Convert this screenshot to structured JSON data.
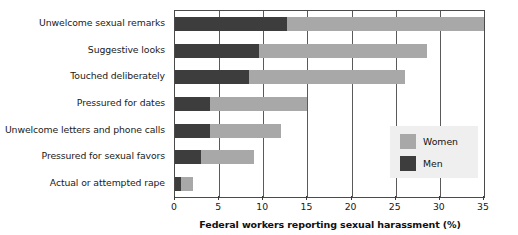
{
  "chart_data": {
    "type": "bar",
    "orientation": "horizontal",
    "stacked": true,
    "title": "",
    "xlabel": "Federal workers reporting sexual harassment (%)",
    "ylabel": "",
    "xlim": [
      0,
      35
    ],
    "xticks": [
      0,
      5,
      10,
      15,
      20,
      25,
      30,
      35
    ],
    "xtick_labels": [
      "0",
      "5",
      "10",
      "15",
      "20",
      "25",
      "30",
      "35"
    ],
    "grid": true,
    "legend_position": "inside-right",
    "categories": [
      "Unwelcome sexual remarks",
      "Suggestive looks",
      "Touched deliberately",
      "Pressured for dates",
      "Unwelcome letters and phone calls",
      "Pressured for sexual favors",
      "Actual or attempted rape"
    ],
    "series": [
      {
        "name": "Men",
        "color": "#3d3d3d",
        "values": [
          12.7,
          9.5,
          8.4,
          4.0,
          4.0,
          3.0,
          0.7
        ]
      },
      {
        "name": "Women",
        "color": "#a8a8a8",
        "values": [
          22.3,
          19.0,
          17.6,
          11.0,
          8.0,
          6.0,
          1.3
        ]
      }
    ],
    "totals": [
      35.0,
      28.5,
      26.0,
      15.0,
      12.0,
      9.0,
      2.0
    ]
  },
  "legend": {
    "entries": [
      {
        "label": "Women",
        "color": "#a8a8a8"
      },
      {
        "label": "Men",
        "color": "#3d3d3d"
      }
    ]
  },
  "colors": {
    "men": "#3d3d3d",
    "women": "#a8a8a8",
    "axis": "#4a4a4a",
    "grid": "#5a5a5a",
    "legend_background": "#efefef",
    "background": "#ffffff"
  }
}
